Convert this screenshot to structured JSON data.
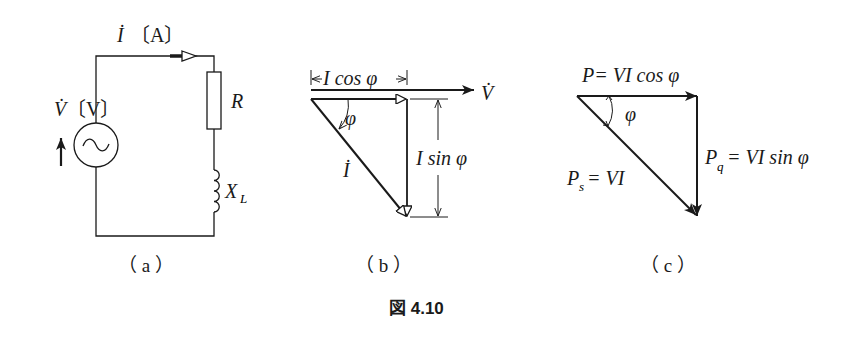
{
  "panel_a": {
    "current_label": "İ",
    "current_unit": "〔A〕",
    "voltage_label": "V̇",
    "voltage_unit": "〔V〕",
    "resistor_label": "R",
    "inductor_label": "X",
    "inductor_sub": "L",
    "caption": "（ a ）"
  },
  "panel_b": {
    "icos_label": "I cos φ",
    "v_label": "V̇",
    "phi_label": "φ",
    "i_label": "İ",
    "isin_label": "I sin φ",
    "caption": "（ b ）"
  },
  "panel_c": {
    "p_label": "P= VI cos φ",
    "phi_label": "φ",
    "pq_prefix": "P",
    "pq_sub": "q",
    "pq_rest": "= VI sin φ",
    "ps_prefix": "P",
    "ps_sub": "s",
    "ps_rest": "= VI",
    "caption": "（ c ）"
  },
  "figure_caption": "図 4.10"
}
